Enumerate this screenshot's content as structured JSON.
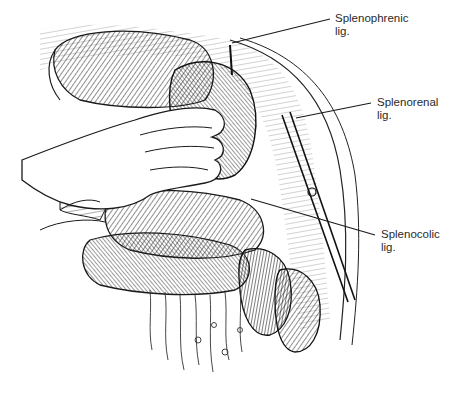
{
  "illustration": {
    "subject": "Surgical exposure of spleen with surgeon's hand retracting, showing splenic ligaments",
    "colors": {
      "ink": "#1a1a1a",
      "paper": "#ffffff",
      "label_text": "#2a2a2a"
    }
  },
  "labels": [
    {
      "id": "splenophrenic",
      "line1": "Splenophrenic",
      "line2": "lig.",
      "x": 335,
      "y": 12,
      "leader": {
        "x1": 232,
        "y1": 43,
        "x2": 330,
        "y2": 19
      }
    },
    {
      "id": "splenorenal",
      "line1": "Splenorenal",
      "line2": "lig.",
      "x": 377,
      "y": 96,
      "leader": {
        "x1": 296,
        "y1": 118,
        "x2": 371,
        "y2": 103
      }
    },
    {
      "id": "splenocolic",
      "line1": "Splenocolic",
      "line2": "lig.",
      "x": 381,
      "y": 228,
      "leader": {
        "x1": 251,
        "y1": 199,
        "x2": 375,
        "y2": 235
      }
    }
  ]
}
